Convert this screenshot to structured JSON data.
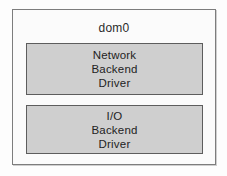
{
  "diagram": {
    "title": "dom0",
    "outer_box": {
      "label": "dom0",
      "fill_color": "#fbfbfb",
      "border_color": "#7d7d7d"
    },
    "boxes": [
      {
        "name": "network-backend-driver",
        "fill_color": "#cfcfcf",
        "border_color": "#5d5d5d",
        "lines": [
          "Network",
          "Backend",
          "Driver"
        ]
      },
      {
        "name": "io-backend-driver",
        "fill_color": "#cfcfcf",
        "border_color": "#5d5d5d",
        "lines": [
          "I/O",
          "Backend",
          "Driver"
        ]
      }
    ],
    "background_color": "#fdfdfd",
    "text_color": "#232323"
  }
}
